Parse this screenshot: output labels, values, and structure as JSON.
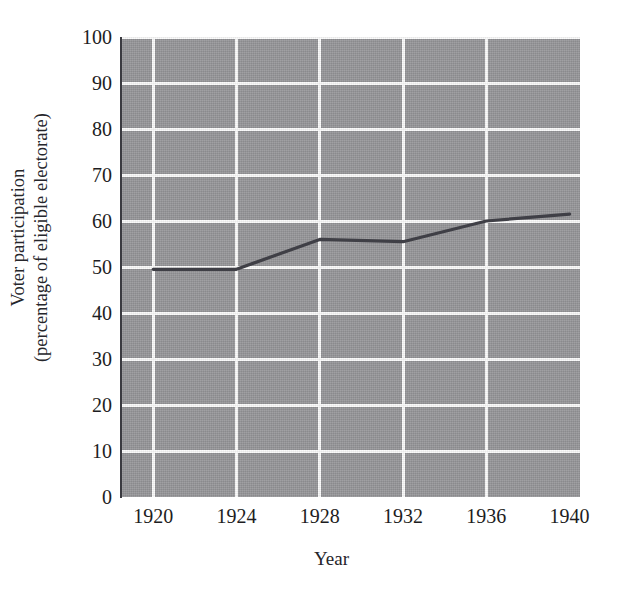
{
  "figure": {
    "title_remnant": "",
    "background_color": "#ffffff",
    "plot_background_color": "#969699",
    "gridline_color": "#fbfbfb",
    "line_color": "#3f3f46"
  },
  "chart_data": {
    "type": "line",
    "title": "",
    "xlabel": "Year",
    "ylabel": "Voter participation (percentage of eligible electorate)",
    "ylabel_line1": "Voter participation",
    "ylabel_line2": "(percentage of eligible electorate)",
    "x": [
      1920,
      1924,
      1928,
      1932,
      1936,
      1940
    ],
    "xtick_labels": [
      "1920",
      "1924",
      "1928",
      "1932",
      "1936",
      "1940"
    ],
    "ytick_labels": [
      "100",
      "90",
      "80",
      "70",
      "60",
      "50",
      "40",
      "30",
      "20",
      "10",
      "0"
    ],
    "ytick_values": [
      100,
      90,
      80,
      70,
      60,
      50,
      40,
      30,
      20,
      10,
      0
    ],
    "xlim": [
      1918.5,
      1940.5
    ],
    "ylim": [
      0,
      100
    ],
    "grid": true,
    "legend": "none",
    "series": [
      {
        "name": "Voter participation",
        "values": [
          49.5,
          49.5,
          56.0,
          55.5,
          60.0,
          61.5
        ]
      }
    ]
  }
}
